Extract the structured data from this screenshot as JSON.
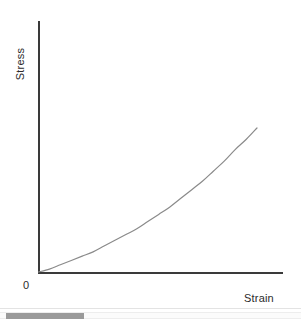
{
  "chart_data": {
    "type": "line",
    "title": "",
    "xlabel": "Strain",
    "ylabel": "Stress",
    "origin_label": "0",
    "grid": false,
    "legend": null,
    "xlim": [
      0,
      1
    ],
    "ylim": [
      0,
      1
    ],
    "axis_ticks": {
      "x": [],
      "y": []
    },
    "annotations": [],
    "series": [
      {
        "name": "stress-strain",
        "color": "#8a8a8a",
        "linewidth": 1,
        "description": "Monotonically increasing convex (strain-stiffening) stress-strain curve starting at the origin",
        "x": [
          0.0,
          0.05,
          0.1,
          0.15,
          0.2,
          0.25,
          0.3,
          0.35,
          0.4,
          0.45,
          0.5,
          0.55,
          0.6,
          0.65,
          0.7,
          0.75,
          0.8,
          0.85,
          0.9,
          0.95,
          1.0
        ],
        "y": [
          0.0,
          0.02,
          0.05,
          0.08,
          0.11,
          0.14,
          0.18,
          0.22,
          0.26,
          0.3,
          0.35,
          0.4,
          0.45,
          0.51,
          0.57,
          0.63,
          0.7,
          0.77,
          0.85,
          0.92,
          1.0
        ]
      }
    ]
  },
  "axes": {
    "y_axis_color": "#3a3a3a",
    "x_axis_color": "#3a3a3a"
  },
  "scrollbar": {
    "orientation": "horizontal",
    "thumb_position_pct": 2,
    "thumb_width_pct": 26,
    "thumb_color": "#9a9a9a",
    "track_color": "#fbfbfb"
  }
}
